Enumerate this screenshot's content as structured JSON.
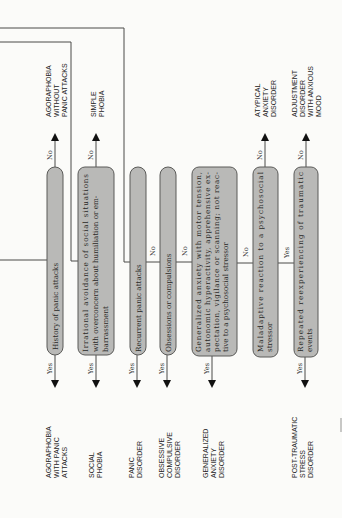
{
  "diagram": {
    "orientation": "rotated-90-ccw",
    "decision_nodes": [
      {
        "id": "n1",
        "text": [
          "History of panic attacks"
        ],
        "yes": "AGORAPHOBIA WITH PANIC ATTACKS",
        "no": "AGORAPHOBIA WITHOUT PANIC ATTACKS"
      },
      {
        "id": "n2",
        "text": [
          "Irrational avoidance of social situations",
          "with overconcern about humiliation or em-",
          "barrassment"
        ],
        "yes": "SOCIAL PHOBIA",
        "no": "SIMPLE PHOBIA"
      },
      {
        "id": "n3",
        "text": [
          "Recurrent panic attacks"
        ],
        "yes": "PANIC DISORDER",
        "no": "n4"
      },
      {
        "id": "n4",
        "text": [
          "Obsessions or compulsions"
        ],
        "yes": "OBSESSIVE COMPULSIVE DISORDER",
        "no": "n5"
      },
      {
        "id": "n5",
        "text": [
          "Generalized anxiety with motor tension,",
          "autonomic hyperactivity, apprehensive ex-",
          "pectation, vigilance or scanning; not reac-",
          "tive to a psychosocial stressor"
        ],
        "yes": "GENERALIZED ANXIETY DISORDER",
        "no": "n6"
      },
      {
        "id": "n6",
        "text": [
          "Maladaptive reaction to a psychosocial",
          "stressor"
        ],
        "yes": "n7",
        "no": "ATYPICAL ANXIETY DISORDER"
      },
      {
        "id": "n7",
        "text": [
          "Repeated reexperiencing of traumatic",
          "events"
        ],
        "yes": "POST-TRAUMATIC STRESS DISORDER",
        "no": "ADJUSTMENT DISORDER WITH ANXIOUS MOOD"
      }
    ],
    "outcomes_top": [
      {
        "lines": [
          "AGORAPHOBIA",
          "WITHOUT",
          "PANIC ATTACKS"
        ]
      },
      {
        "lines": [
          "SIMPLE",
          "PHOBIA"
        ]
      },
      {
        "lines": [
          "ATYPICAL",
          "ANXIETY",
          "DISORDER"
        ]
      },
      {
        "lines": [
          "ADJUSTMENT",
          "DISORDER",
          "WITH ANXIOUS",
          "MOOD"
        ]
      }
    ],
    "outcomes_bottom": [
      {
        "lines": [
          "AGORAPHOBIA",
          "WITH PANIC",
          "ATTACKS"
        ]
      },
      {
        "lines": [
          "SOCIAL",
          "PHOBIA"
        ]
      },
      {
        "lines": [
          "PANIC",
          "DISORDER"
        ]
      },
      {
        "lines": [
          "OBSESSIVE",
          "COMPULSIVE",
          "DISORDER"
        ]
      },
      {
        "lines": [
          "GENERALIZED",
          "ANXIETY",
          "DISORDER"
        ]
      },
      {
        "lines": [
          "POST-TRAUMATIC",
          "STRESS",
          "DISORDER"
        ]
      }
    ],
    "labels": {
      "yes": "Yes",
      "no": "No"
    }
  }
}
